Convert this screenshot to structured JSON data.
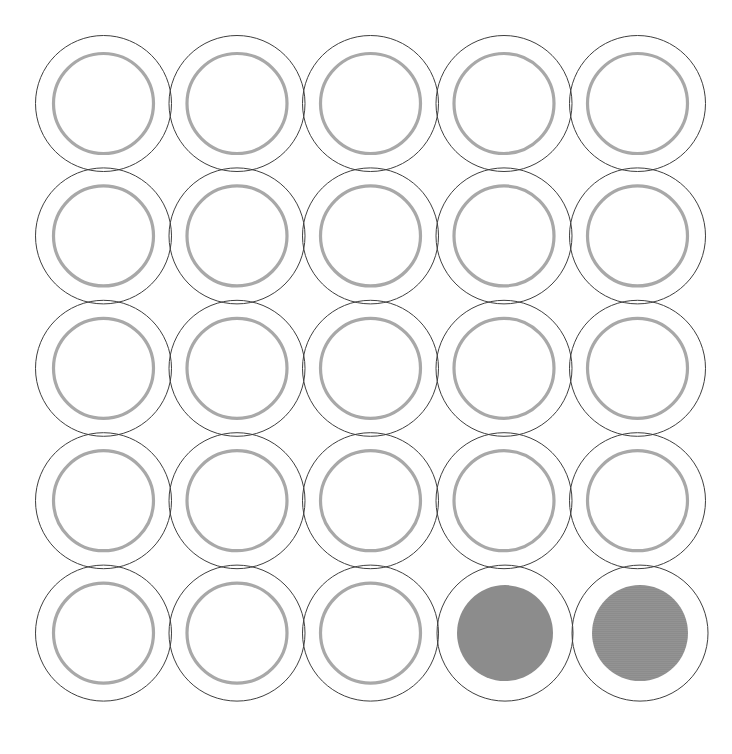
{
  "canvas": {
    "width": 732,
    "height": 754,
    "background_color": "#ffffff",
    "title": "circle-grid"
  },
  "grid": {
    "rows": 5,
    "columns": 5,
    "total_cells": 25,
    "origin_x": 103.5,
    "origin_y": 103.5,
    "pitch_x": 133.5,
    "pitch_y": 132.4
  },
  "geometry": {
    "outer_radius": 68,
    "inner_radius": 50,
    "filled_radius": 48,
    "outer_stroke_width": 1,
    "inner_stroke_width": 3.2
  },
  "colors": {
    "outer_stroke": "#3f3f3f",
    "inner_stroke": "#a8a8a8",
    "fill_solid": "#8c8c8c",
    "fill_textured": "#8c8c8c",
    "background": "#ffffff"
  },
  "chart_data": {
    "type": "scatter",
    "title": "",
    "subtitle": "",
    "xlabel": "",
    "ylabel": "",
    "grid": false,
    "legend_position": "none",
    "x": [
      1,
      2,
      3,
      4,
      5
    ],
    "y": [
      1,
      2,
      3,
      4,
      5
    ],
    "xlim": [
      0.5,
      5.5
    ],
    "ylim": [
      0.5,
      5.5
    ],
    "series": [
      {
        "name": "empty-rings",
        "values": 23
      },
      {
        "name": "filled-disks",
        "values": 2
      }
    ],
    "annotations": []
  },
  "cells": [
    {
      "id": "cell-r1c1",
      "row": 1,
      "col": 1,
      "cx": 103.5,
      "cy": 103.5,
      "state": "empty",
      "fill_style": "none"
    },
    {
      "id": "cell-r1c2",
      "row": 1,
      "col": 2,
      "cx": 237.0,
      "cy": 103.5,
      "state": "empty",
      "fill_style": "none"
    },
    {
      "id": "cell-r1c3",
      "row": 1,
      "col": 3,
      "cx": 370.5,
      "cy": 103.5,
      "state": "empty",
      "fill_style": "none"
    },
    {
      "id": "cell-r1c4",
      "row": 1,
      "col": 4,
      "cx": 504.0,
      "cy": 103.5,
      "state": "empty",
      "fill_style": "none"
    },
    {
      "id": "cell-r1c5",
      "row": 1,
      "col": 5,
      "cx": 637.5,
      "cy": 103.5,
      "state": "empty",
      "fill_style": "none"
    },
    {
      "id": "cell-r2c1",
      "row": 2,
      "col": 1,
      "cx": 103.5,
      "cy": 235.9,
      "state": "empty",
      "fill_style": "none"
    },
    {
      "id": "cell-r2c2",
      "row": 2,
      "col": 2,
      "cx": 237.0,
      "cy": 235.9,
      "state": "empty",
      "fill_style": "none"
    },
    {
      "id": "cell-r2c3",
      "row": 2,
      "col": 3,
      "cx": 370.5,
      "cy": 235.9,
      "state": "empty",
      "fill_style": "none"
    },
    {
      "id": "cell-r2c4",
      "row": 2,
      "col": 4,
      "cx": 504.0,
      "cy": 235.9,
      "state": "empty",
      "fill_style": "none"
    },
    {
      "id": "cell-r2c5",
      "row": 2,
      "col": 5,
      "cx": 637.5,
      "cy": 235.9,
      "state": "empty",
      "fill_style": "none"
    },
    {
      "id": "cell-r3c1",
      "row": 3,
      "col": 1,
      "cx": 103.5,
      "cy": 368.3,
      "state": "empty",
      "fill_style": "none"
    },
    {
      "id": "cell-r3c2",
      "row": 3,
      "col": 2,
      "cx": 237.0,
      "cy": 368.3,
      "state": "empty",
      "fill_style": "none"
    },
    {
      "id": "cell-r3c3",
      "row": 3,
      "col": 3,
      "cx": 370.5,
      "cy": 368.3,
      "state": "empty",
      "fill_style": "none"
    },
    {
      "id": "cell-r3c4",
      "row": 3,
      "col": 4,
      "cx": 504.0,
      "cy": 368.3,
      "state": "empty",
      "fill_style": "none"
    },
    {
      "id": "cell-r3c5",
      "row": 3,
      "col": 5,
      "cx": 637.5,
      "cy": 368.3,
      "state": "empty",
      "fill_style": "none"
    },
    {
      "id": "cell-r4c1",
      "row": 4,
      "col": 1,
      "cx": 103.5,
      "cy": 500.7,
      "state": "empty",
      "fill_style": "none"
    },
    {
      "id": "cell-r4c2",
      "row": 4,
      "col": 2,
      "cx": 237.0,
      "cy": 500.7,
      "state": "empty",
      "fill_style": "none"
    },
    {
      "id": "cell-r4c3",
      "row": 4,
      "col": 3,
      "cx": 370.5,
      "cy": 500.7,
      "state": "empty",
      "fill_style": "none"
    },
    {
      "id": "cell-r4c4",
      "row": 4,
      "col": 4,
      "cx": 504.0,
      "cy": 500.7,
      "state": "empty",
      "fill_style": "none"
    },
    {
      "id": "cell-r4c5",
      "row": 4,
      "col": 5,
      "cx": 637.5,
      "cy": 500.7,
      "state": "empty",
      "fill_style": "none"
    },
    {
      "id": "cell-r5c1",
      "row": 5,
      "col": 1,
      "cx": 103.5,
      "cy": 633.1,
      "state": "empty",
      "fill_style": "none"
    },
    {
      "id": "cell-r5c2",
      "row": 5,
      "col": 2,
      "cx": 237.0,
      "cy": 633.1,
      "state": "empty",
      "fill_style": "none"
    },
    {
      "id": "cell-r5c3",
      "row": 5,
      "col": 3,
      "cx": 370.5,
      "cy": 633.1,
      "state": "empty",
      "fill_style": "none"
    },
    {
      "id": "cell-r5c4",
      "row": 5,
      "col": 4,
      "cx": 505.0,
      "cy": 633.1,
      "state": "filled",
      "fill_style": "solid"
    },
    {
      "id": "cell-r5c5",
      "row": 5,
      "col": 5,
      "cx": 640.0,
      "cy": 633.1,
      "state": "filled",
      "fill_style": "textured"
    }
  ]
}
